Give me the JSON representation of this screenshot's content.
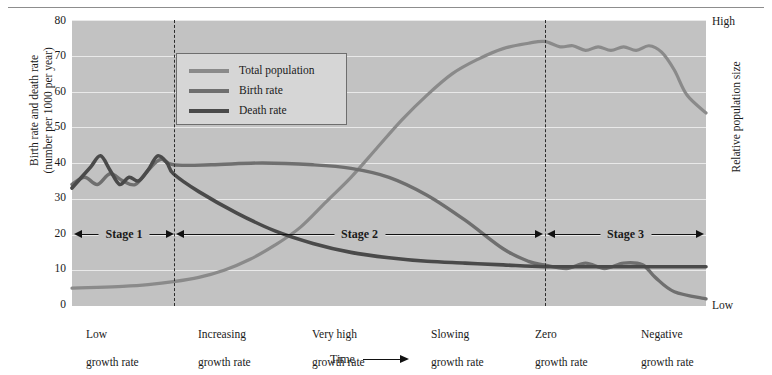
{
  "axes": {
    "left_title": "Birth rate and death rate\n(number per 1000 per year)",
    "left_title_line1": "Birth rate and death rate",
    "left_title_line2": "(number per 1000 per year)",
    "right_title": "Relative population size",
    "right_high": "High",
    "right_low": "Low",
    "x_label": "Time",
    "yticks": [
      "80",
      "70",
      "60",
      "50",
      "40",
      "30",
      "20",
      "10",
      "0"
    ]
  },
  "legend": {
    "items": [
      {
        "label": "Total population",
        "color": "#8a8a8a"
      },
      {
        "label": "Birth rate",
        "color": "#6f6f6f"
      },
      {
        "label": "Death rate",
        "color": "#4a4a4a"
      }
    ]
  },
  "stages": [
    {
      "label": "Stage 1"
    },
    {
      "label": "Stage 2"
    },
    {
      "label": "Stage 3"
    }
  ],
  "phases": [
    {
      "line1": "Low",
      "line2": "growth rate"
    },
    {
      "line1": "Increasing",
      "line2": "growth rate"
    },
    {
      "line1": "Very high",
      "line2": "growth rate"
    },
    {
      "line1": "Slowing",
      "line2": "growth rate"
    },
    {
      "line1": "Zero",
      "line2": "growth rate"
    },
    {
      "line1": "Negative",
      "line2": "growth rate"
    }
  ],
  "colors": {
    "plot_background": "#c2c2c2",
    "gridline": "#e9e9e9",
    "total_population": "#8a8a8a",
    "birth_rate": "#6f6f6f",
    "death_rate": "#4a4a4a",
    "divider": "#2b2b2b"
  },
  "chart_data": {
    "type": "line",
    "xlabel": "Time",
    "ylabel": "Birth rate and death rate (number per 1000 per year)",
    "y2label": "Relative population size",
    "ylim": [
      0,
      80
    ],
    "yticks": [
      0,
      10,
      20,
      30,
      40,
      50,
      60,
      70,
      80
    ],
    "grid": true,
    "legend_position": "top-left",
    "stage_boundaries_x": [
      0.16,
      0.745
    ],
    "series": [
      {
        "name": "Total population",
        "color": "#8a8a8a",
        "x": [
          0.0,
          0.04,
          0.08,
          0.12,
          0.16,
          0.2,
          0.24,
          0.28,
          0.32,
          0.36,
          0.4,
          0.44,
          0.48,
          0.52,
          0.56,
          0.6,
          0.64,
          0.68,
          0.72,
          0.745,
          0.77,
          0.79,
          0.81,
          0.83,
          0.85,
          0.87,
          0.89,
          0.91,
          0.93,
          0.95,
          0.97,
          1.0
        ],
        "values": [
          5,
          5.2,
          5.5,
          6,
          6.8,
          8,
          10,
          13,
          17,
          22,
          29,
          36,
          44,
          52,
          59,
          65,
          69,
          72,
          73.5,
          74,
          72.5,
          72.8,
          71.5,
          72.5,
          71.5,
          72.5,
          71.5,
          72.8,
          71,
          66,
          59,
          54
        ]
      },
      {
        "name": "Birth rate",
        "color": "#6f6f6f",
        "x": [
          0.0,
          0.02,
          0.04,
          0.06,
          0.08,
          0.1,
          0.12,
          0.14,
          0.16,
          0.22,
          0.3,
          0.38,
          0.44,
          0.5,
          0.56,
          0.62,
          0.68,
          0.72,
          0.745,
          0.78,
          0.81,
          0.84,
          0.87,
          0.9,
          0.92,
          0.95,
          1.0
        ],
        "values": [
          34,
          36,
          34,
          37,
          35,
          34,
          38,
          41,
          39.5,
          39.5,
          40,
          39.5,
          38.5,
          36,
          31,
          24,
          16,
          12.5,
          11.5,
          10.5,
          12,
          10.5,
          12,
          11.5,
          8,
          4,
          2
        ]
      },
      {
        "name": "Death rate",
        "color": "#4a4a4a",
        "x": [
          0.0,
          0.015,
          0.03,
          0.045,
          0.06,
          0.075,
          0.09,
          0.105,
          0.12,
          0.135,
          0.15,
          0.16,
          0.2,
          0.26,
          0.32,
          0.38,
          0.44,
          0.5,
          0.56,
          0.62,
          0.68,
          0.745,
          0.82,
          0.9,
          1.0
        ],
        "values": [
          33,
          36,
          39,
          42,
          38,
          34,
          36,
          35,
          38,
          42,
          40,
          37,
          32,
          26,
          21,
          17.5,
          15,
          13.5,
          12.5,
          12,
          11.5,
          11,
          11,
          11,
          11
        ]
      }
    ]
  }
}
